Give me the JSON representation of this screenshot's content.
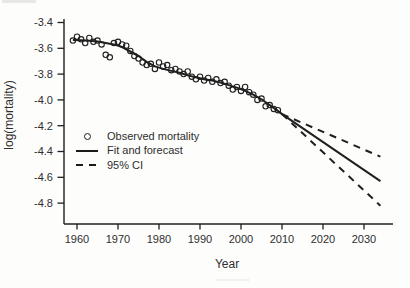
{
  "figure": {
    "background": "#fdfdfc",
    "ink_color": "#1f1f1f",
    "text_color": "#2e2e2e"
  },
  "chart_data": {
    "type": "line",
    "title": "",
    "xlabel": "Year",
    "ylabel": "log(mortality)",
    "xlim": [
      1956.8,
      2036.5
    ],
    "ylim": [
      -4.96,
      -3.37
    ],
    "x_ticks": [
      1960,
      1970,
      1980,
      1990,
      2000,
      2010,
      2020,
      2030
    ],
    "y_ticks": [
      -3.4,
      -3.6,
      -3.8,
      -4.0,
      -4.2,
      -4.4,
      -4.6,
      -4.8
    ],
    "grid": false,
    "legend": {
      "position": "inside-left-middle",
      "entries": [
        "Observed mortality",
        "Fit and forecast",
        "95% CI"
      ]
    },
    "series": [
      {
        "name": "Observed mortality",
        "type": "scatter",
        "marker": "open-circle",
        "x": [
          1959,
          1960,
          1961,
          1962,
          1963,
          1964,
          1965,
          1966,
          1967,
          1968,
          1969,
          1970,
          1971,
          1972,
          1973,
          1974,
          1975,
          1976,
          1977,
          1978,
          1979,
          1980,
          1981,
          1982,
          1983,
          1984,
          1985,
          1986,
          1987,
          1988,
          1989,
          1990,
          1991,
          1992,
          1993,
          1994,
          1995,
          1996,
          1997,
          1998,
          1999,
          2000,
          2001,
          2002,
          2003,
          2004,
          2005,
          2006,
          2007,
          2008,
          2009
        ],
        "y": [
          -3.54,
          -3.51,
          -3.53,
          -3.56,
          -3.52,
          -3.55,
          -3.54,
          -3.57,
          -3.65,
          -3.67,
          -3.56,
          -3.55,
          -3.57,
          -3.58,
          -3.62,
          -3.66,
          -3.68,
          -3.71,
          -3.73,
          -3.72,
          -3.76,
          -3.71,
          -3.74,
          -3.73,
          -3.77,
          -3.76,
          -3.78,
          -3.8,
          -3.78,
          -3.82,
          -3.84,
          -3.82,
          -3.85,
          -3.83,
          -3.86,
          -3.84,
          -3.87,
          -3.86,
          -3.89,
          -3.92,
          -3.9,
          -3.93,
          -3.9,
          -3.94,
          -3.96,
          -4.0,
          -3.99,
          -4.05,
          -4.04,
          -4.07,
          -4.08
        ]
      },
      {
        "name": "Fit and forecast",
        "type": "line",
        "style": "solid",
        "x": [
          1959,
          1961,
          1963,
          1965,
          1967,
          1969,
          1971,
          1973,
          1975,
          1977,
          1979,
          1981,
          1983,
          1985,
          1987,
          1989,
          1991,
          1993,
          1995,
          1997,
          1999,
          2001,
          2003,
          2005,
          2007,
          2009,
          2010,
          2034
        ],
        "y": [
          -3.535,
          -3.538,
          -3.542,
          -3.548,
          -3.558,
          -3.57,
          -3.59,
          -3.625,
          -3.66,
          -3.705,
          -3.74,
          -3.76,
          -3.775,
          -3.79,
          -3.81,
          -3.825,
          -3.84,
          -3.85,
          -3.865,
          -3.885,
          -3.905,
          -3.93,
          -3.96,
          -3.995,
          -4.04,
          -4.085,
          -4.11,
          -4.63
        ]
      },
      {
        "name": "95% CI upper",
        "type": "line",
        "style": "dashed",
        "x": [
          2010,
          2034
        ],
        "y": [
          -4.11,
          -4.44
        ]
      },
      {
        "name": "95% CI lower",
        "type": "line",
        "style": "dashed",
        "x": [
          2010,
          2034
        ],
        "y": [
          -4.11,
          -4.82
        ]
      }
    ]
  }
}
